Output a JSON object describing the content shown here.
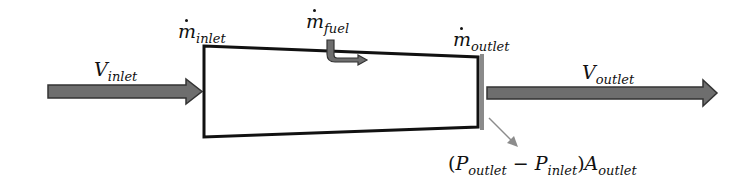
{
  "diagram": {
    "type": "control-volume-thrust",
    "labels": {
      "m_inlet": {
        "symbol": "ṁ",
        "base": "m",
        "subscript": "inlet"
      },
      "m_fuel": {
        "symbol": "ṁ",
        "base": "m",
        "subscript": "fuel"
      },
      "m_outlet": {
        "symbol": "ṁ",
        "base": "m",
        "subscript": "outlet"
      },
      "v_inlet": {
        "base": "V",
        "subscript": "inlet"
      },
      "v_outlet": {
        "base": "V",
        "subscript": "outlet"
      },
      "pressure_term": {
        "open": "(",
        "p1": "P",
        "p1_sub": "outlet",
        "minus": " − ",
        "p2": "P",
        "p2_sub": "inlet",
        "close": ")",
        "a": "A",
        "a_sub": "outlet"
      }
    },
    "colors": {
      "arrow_fill": "#6e6e6e",
      "arrow_stroke": "#333333",
      "box_stroke": "#111111",
      "plate": "#8a8a8a",
      "pointer": "#8c8c8c"
    }
  }
}
